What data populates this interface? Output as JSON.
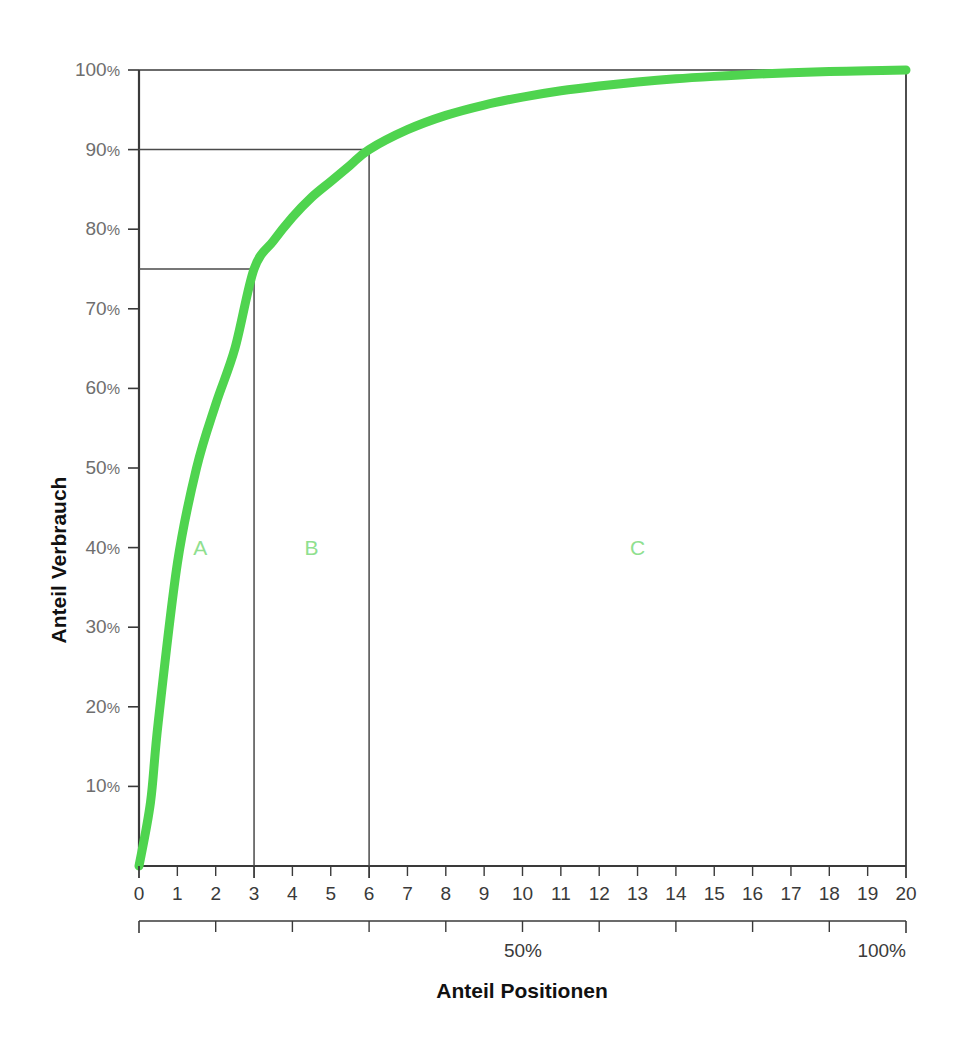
{
  "chart_data": {
    "type": "line",
    "title": "",
    "xlabel": "Anteil Positionen",
    "ylabel": "Anteil Verbrauch",
    "xlim": [
      0,
      20
    ],
    "ylim": [
      0,
      100
    ],
    "grid": false,
    "legend_position": "none",
    "series": [
      {
        "name": "Kumulierter Verbrauch",
        "color": "#4FD44F",
        "x": [
          0,
          0.3,
          0.5,
          1,
          1.5,
          2,
          2.5,
          3,
          3.5,
          4,
          4.5,
          5,
          5.5,
          6,
          7,
          8,
          9,
          10,
          11,
          12,
          13,
          14,
          15,
          16,
          17,
          18,
          19,
          20
        ],
        "y": [
          0,
          8,
          18,
          38,
          50,
          58,
          65,
          75,
          78.5,
          81.5,
          84,
          86,
          88,
          90,
          92.5,
          94.3,
          95.6,
          96.6,
          97.4,
          98,
          98.5,
          98.9,
          99.2,
          99.45,
          99.65,
          99.8,
          99.92,
          100
        ]
      }
    ],
    "y_ticks": [
      10,
      20,
      30,
      40,
      50,
      60,
      70,
      80,
      90,
      100
    ],
    "y_tick_labels": [
      "10%",
      "20%",
      "30%",
      "40%",
      "50%",
      "60%",
      "70%",
      "80%",
      "90%",
      "100%"
    ],
    "x_ticks": [
      0,
      1,
      2,
      3,
      4,
      5,
      6,
      7,
      8,
      9,
      10,
      11,
      12,
      13,
      14,
      15,
      16,
      17,
      18,
      19,
      20
    ],
    "x_tick_labels": [
      "0",
      "1",
      "2",
      "3",
      "4",
      "5",
      "6",
      "7",
      "8",
      "9",
      "10",
      "11",
      "12",
      "13",
      "14",
      "15",
      "16",
      "17",
      "18",
      "19",
      "20"
    ],
    "secondary_x_axis": {
      "label_50": "50%",
      "label_100": "100%",
      "tick_count": 10,
      "range": [
        0,
        100
      ]
    },
    "annotations": [
      {
        "name": "zone-a",
        "label": "A",
        "x_center": 1.6,
        "y": 40,
        "color": "#8fe08f"
      },
      {
        "name": "zone-b",
        "label": "B",
        "x_center": 4.5,
        "y": 40,
        "color": "#8fe08f"
      },
      {
        "name": "zone-c",
        "label": "C",
        "x_center": 13.0,
        "y": 40,
        "color": "#8fe08f"
      }
    ],
    "reference_lines": [
      {
        "name": "a-b-threshold",
        "y_value": 75,
        "x_value": 3,
        "label": "75%"
      },
      {
        "name": "b-c-threshold",
        "y_value": 90,
        "x_value": 6,
        "label": "90%"
      }
    ],
    "colors": {
      "curve": "#4FD44F",
      "zone_label": "#8fe08f",
      "axis": "#3a3a3a",
      "tick_text": "#6e6e6e",
      "background": "#ffffff"
    }
  }
}
